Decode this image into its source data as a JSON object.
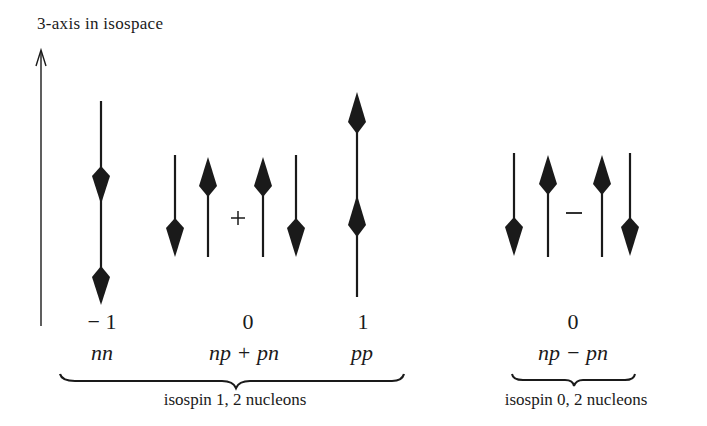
{
  "diagram": {
    "axis_label": "3-axis in isospace",
    "states": [
      {
        "id": "nn",
        "t3": "− 1",
        "label": "nn",
        "arrows": [
          "down",
          "down"
        ]
      },
      {
        "id": "np_plus_pn",
        "t3": "0",
        "label": "np + pn",
        "arrows": [
          "down",
          "up",
          "+",
          "up",
          "down"
        ]
      },
      {
        "id": "pp",
        "t3": "1",
        "label": "pp",
        "arrows": [
          "up",
          "up"
        ]
      },
      {
        "id": "np_minus_pn",
        "t3": "0",
        "label": "np − pn",
        "arrows": [
          "down",
          "up",
          "−",
          "up",
          "down"
        ]
      }
    ],
    "operators": {
      "plus": "+",
      "minus": "−"
    },
    "groups": [
      {
        "id": "triplet",
        "label": "isospin 1, 2 nucleons"
      },
      {
        "id": "singlet",
        "label": "isospin 0, 2 nucleons"
      }
    ],
    "colors": {
      "ink": "#1a1a1a",
      "background": "#ffffff"
    }
  }
}
